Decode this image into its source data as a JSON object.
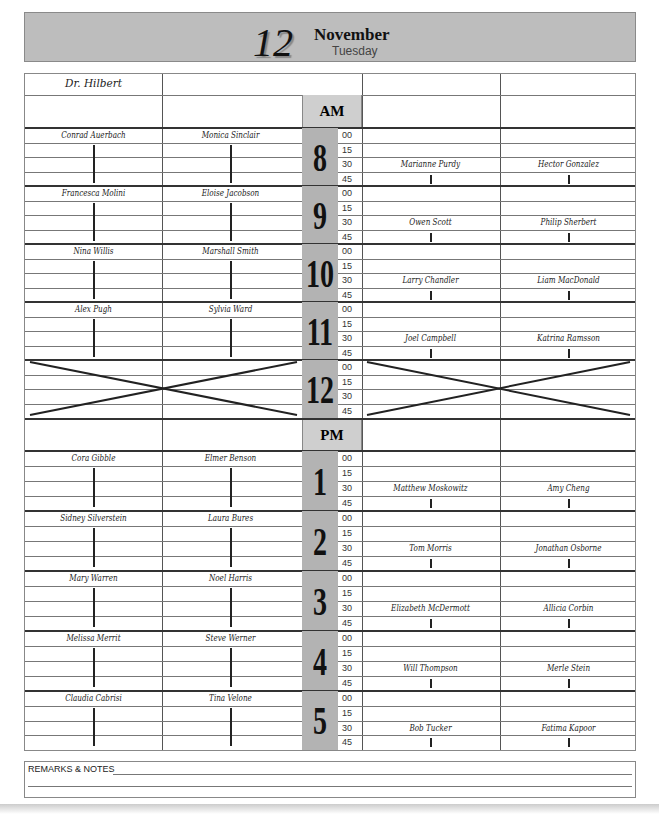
{
  "header": {
    "day_number": "12",
    "month": "November",
    "weekday": "Tuesday"
  },
  "columns": {
    "doctor": "Dr. Hilbert",
    "am_label": "AM",
    "pm_label": "PM"
  },
  "minutes": [
    "00",
    "15",
    "30",
    "45"
  ],
  "hours": [
    {
      "label": "8",
      "left1": "Conrad Auerbach",
      "left2": "Monica Sinclair",
      "right1": "Marianne Purdy",
      "right2": "Hector Gonzalez",
      "blocked": false
    },
    {
      "label": "9",
      "left1": "Francesca Molini",
      "left2": "Eloise Jacobson",
      "right1": "Owen Scott",
      "right2": "Philip Sherbert",
      "blocked": false
    },
    {
      "label": "10",
      "left1": "Nina Willis",
      "left2": "Marshall Smith",
      "right1": "Larry Chandler",
      "right2": "Liam MacDonald",
      "blocked": false
    },
    {
      "label": "11",
      "left1": "Alex Pugh",
      "left2": "Sylvia Ward",
      "right1": "Joel Campbell",
      "right2": "Katrina Ramsson",
      "blocked": false
    },
    {
      "label": "12",
      "left1": "",
      "left2": "",
      "right1": "",
      "right2": "",
      "blocked": true
    },
    {
      "label": "1",
      "left1": "Cora Gibble",
      "left2": "Elmer Benson",
      "right1": "Matthew Moskowitz",
      "right2": "Amy Cheng",
      "blocked": false
    },
    {
      "label": "2",
      "left1": "Sidney Silverstein",
      "left2": "Laura Bures",
      "right1": "Tom Morris",
      "right2": "Jonathan Osborne",
      "blocked": false
    },
    {
      "label": "3",
      "left1": "Mary Warren",
      "left2": "Noel Harris",
      "right1": "Elizabeth McDermott",
      "right2": "Allicia Corbin",
      "blocked": false
    },
    {
      "label": "4",
      "left1": "Melissa Merrit",
      "left2": "Steve Werner",
      "right1": "Will Thompson",
      "right2": "Merle Stein",
      "blocked": false
    },
    {
      "label": "5",
      "left1": "Claudia Cabrisi",
      "left2": "Tina Velone",
      "right1": "Bob Tucker",
      "right2": "Fatima Kapoor",
      "blocked": false
    }
  ],
  "remarks": {
    "label": "REMARKS & NOTES"
  },
  "colors": {
    "band": "#bdbdbd",
    "hour_cell": "#b3b3b3",
    "ampm_cell": "#cfcfcf"
  }
}
